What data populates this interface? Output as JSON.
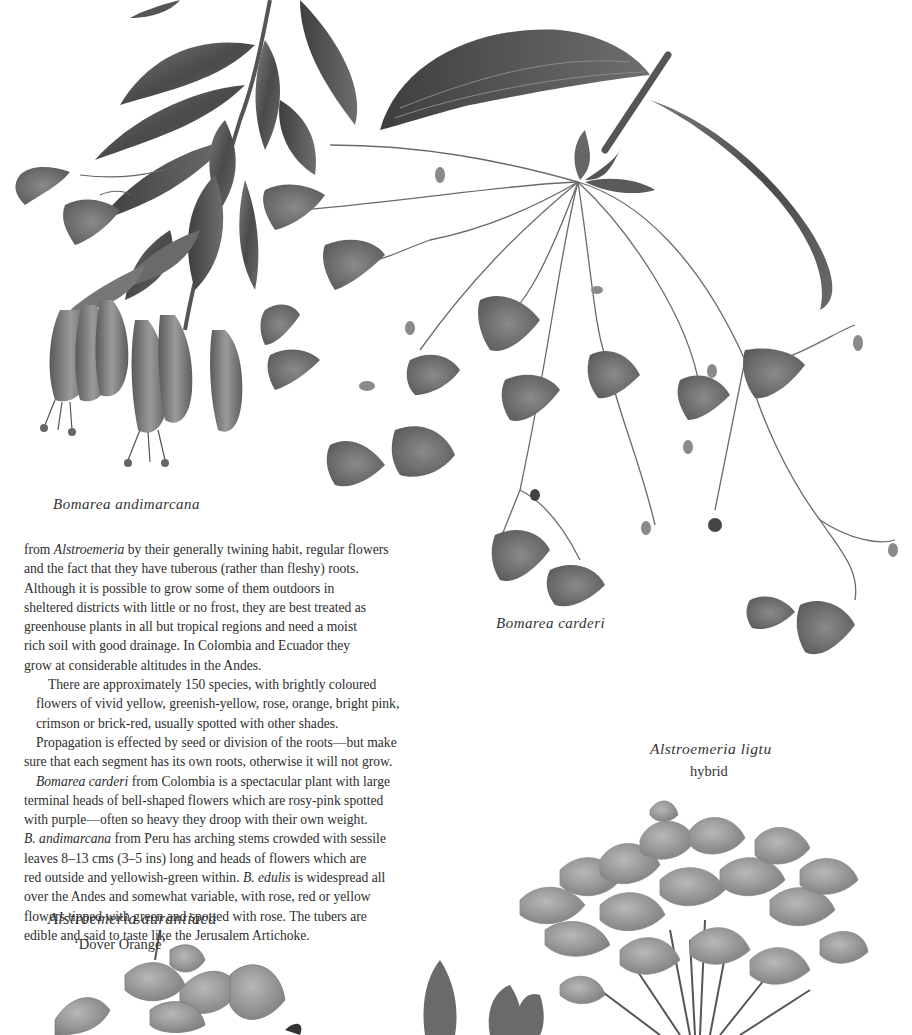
{
  "page": {
    "background": "#ffffff",
    "ink_color": "#2d2d2d",
    "illustration_tone": "grayscale"
  },
  "captions": {
    "bomarea_andimarcana": "Bomarea andimarcana",
    "bomarea_carderi": "Bomarea carderi",
    "alstroemeria_ligtu": "Alstroemeria ligtu",
    "alstroemeria_ligtu_sub": "hybrid",
    "alstroemeria_aurantiaca": "Alstroemeria aurantiaca",
    "alstroemeria_aurantiaca_sub": "‘Dover Orange’"
  },
  "body": {
    "para1": [
      {
        "pre": "from ",
        "italic": "Alstroemeria",
        "post": " by their generally twining habit, regular flowers"
      },
      {
        "text": "and the fact that they have tuberous (rather than fleshy) roots."
      },
      {
        "text": "Although it is possible to grow some of them outdoors in"
      },
      {
        "text": "sheltered districts with little or no frost, they are best treated as"
      },
      {
        "text": "greenhouse plants in all but tropical regions and need a moist"
      },
      {
        "text": "rich soil with good drainage. In Colombia and Ecuador they"
      },
      {
        "text": "grow at considerable altitudes in the Andes."
      }
    ],
    "para2": [
      {
        "text": "There are approximately 150 species, with brightly coloured"
      },
      {
        "text": "flowers of vivid yellow, greenish-yellow, rose, orange, bright pink,"
      },
      {
        "text": "crimson or brick-red, usually spotted with other shades."
      }
    ],
    "para3": [
      {
        "text": "Propagation is effected by seed or division of the roots—but make"
      },
      {
        "text": "sure that each segment has its own roots, otherwise it will not grow."
      }
    ],
    "para4": [
      {
        "pre": "",
        "italic": "Bomarea carderi",
        "post": " from Colombia is a spectacular plant with large"
      },
      {
        "text": "terminal heads of bell-shaped flowers which are rosy-pink spotted"
      },
      {
        "text": "with purple—often so heavy they droop with their own weight."
      },
      {
        "pre": "",
        "italic": "B. andimarcana",
        "post": " from Peru has arching stems crowded with sessile"
      },
      {
        "text": "leaves 8–13 cms (3–5 ins) long and heads of flowers which are"
      },
      {
        "pre": "red outside and yellowish-green within. ",
        "italic": "B. edulis",
        "post": " is widespread all"
      },
      {
        "text": "over the Andes and somewhat variable, with rose, red or yellow"
      },
      {
        "text": "flowers tipped with green and spotted with rose. The tubers are"
      },
      {
        "text": "edible and said to taste like the Jerusalem Artichoke."
      }
    ]
  },
  "illustrations": [
    {
      "name": "bomarea-andimarcana-illustration",
      "subject": "Bomarea andimarcana"
    },
    {
      "name": "bomarea-carderi-illustration",
      "subject": "Bomarea carderi"
    },
    {
      "name": "alstroemeria-ligtu-illustration",
      "subject": "Alstroemeria ligtu hybrid"
    },
    {
      "name": "alstroemeria-aurantiaca-illustration",
      "subject": "Alstroemeria aurantiaca 'Dover Orange'"
    }
  ]
}
